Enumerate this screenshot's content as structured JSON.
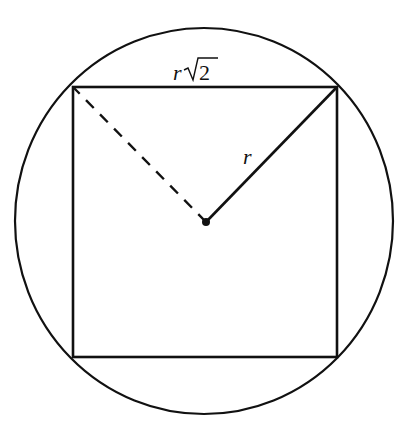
{
  "diagram": {
    "labels": {
      "side_var": "r",
      "side_num": "2",
      "radius": "r"
    },
    "shapes": {
      "circle": {
        "cx": 204,
        "cy": 221,
        "rx": 189,
        "ry": 193
      },
      "square": {
        "x1": 73,
        "y1": 87,
        "x2": 337,
        "y2": 357
      },
      "center": {
        "x": 206,
        "y": 222
      },
      "radius_solid_to": "top-right corner",
      "radius_dashed_to": "top-left corner"
    },
    "colors": {
      "stroke": "#111111",
      "background": "#ffffff"
    }
  }
}
